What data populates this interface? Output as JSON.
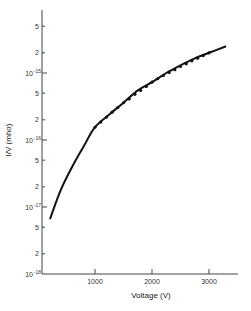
{
  "chart_data": {
    "type": "line",
    "title": "",
    "xlabel": "Voltage (V)",
    "ylabel": "I/V (mho)",
    "xscale": "linear",
    "yscale": "log",
    "xlim": [
      0,
      3500
    ],
    "ylim": [
      1e-18,
      1e-14
    ],
    "grid": false,
    "legend": null,
    "x_ticks": [
      {
        "value": 1000,
        "label": "1000"
      },
      {
        "value": 2000,
        "label": "2000"
      },
      {
        "value": 3000,
        "label": "3000"
      }
    ],
    "y_ticks": [
      {
        "value": 1e-18,
        "label": "10",
        "exp": "-18",
        "major": true
      },
      {
        "value": 2e-18,
        "label": "2",
        "major": false
      },
      {
        "value": 5e-18,
        "label": "5",
        "major": false
      },
      {
        "value": 1e-17,
        "label": "10",
        "exp": "-17",
        "major": true
      },
      {
        "value": 2e-17,
        "label": "2",
        "major": false
      },
      {
        "value": 5e-17,
        "label": "5",
        "major": false
      },
      {
        "value": 1e-16,
        "label": "10",
        "exp": "-16",
        "major": true
      },
      {
        "value": 2e-16,
        "label": "2",
        "major": false
      },
      {
        "value": 5e-16,
        "label": "5",
        "major": false
      },
      {
        "value": 1e-15,
        "label": "10",
        "exp": "-15",
        "major": true
      },
      {
        "value": 2e-15,
        "label": "2",
        "major": false
      },
      {
        "value": 5e-15,
        "label": "5",
        "major": false
      }
    ],
    "series": [
      {
        "name": "fit curve",
        "style": "solid-line",
        "x": [
          210,
          400,
          600,
          800,
          1000,
          1250,
          1500,
          1750,
          2000,
          2250,
          2500,
          2750,
          3000,
          3300
        ],
        "y": [
          6.6e-18,
          1.8e-17,
          4e-17,
          8e-17,
          1.55e-16,
          2.4e-16,
          3.6e-16,
          5.5e-16,
          7.3e-16,
          1e-15,
          1.3e-15,
          1.65e-15,
          2e-15,
          2.5e-15
        ]
      },
      {
        "name": "measured",
        "style": "points",
        "x": [
          1000,
          1100,
          1200,
          1300,
          1400,
          1500,
          1600,
          1700,
          1800,
          1900,
          2000,
          2100,
          2200,
          2300,
          2400,
          2500,
          2600,
          2700,
          2800,
          2900,
          3000
        ],
        "y": [
          1.55e-16,
          1.85e-16,
          2.2e-16,
          2.6e-16,
          3.05e-16,
          3.6e-16,
          4.1e-16,
          4.8e-16,
          5.5e-16,
          6.3e-16,
          7.3e-16,
          8.2e-16,
          9.2e-16,
          1.02e-15,
          1.12e-15,
          1.25e-15,
          1.37e-15,
          1.52e-15,
          1.66e-15,
          1.82e-15,
          2e-15
        ]
      }
    ]
  },
  "plot": {
    "origin_x": 38,
    "origin_y": 274,
    "px_per_volt": 0.057,
    "px_per_decade": 67,
    "axis_top": 10,
    "axis_right": 238,
    "line_color": "#111111",
    "axis_color": "#444444"
  }
}
